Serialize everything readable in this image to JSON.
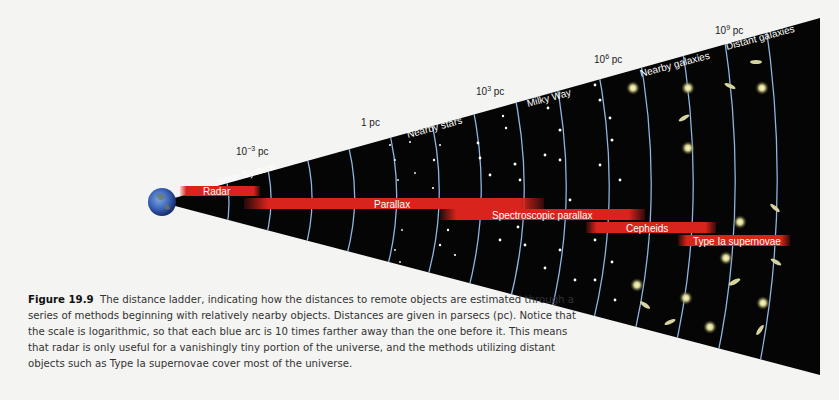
{
  "figure": {
    "number_label": "Figure 19.9",
    "caption": "The distance ladder, indicating how the distances to remote objects are estimated through a series of methods beginning with relatively nearby objects. Distances are given in parsecs (pc). Notice that the scale is logarithmic, so that each blue arc is 10 times farther away than the one before it. This means that radar is only useful for a vanishingly tiny portion of the universe, and the methods utilizing distant objects such as Type Ia supernovae cover most of the universe."
  },
  "distance_labels": [
    {
      "base": "10",
      "exp": "−3",
      "unit": " pc"
    },
    {
      "base": "1 pc",
      "exp": "",
      "unit": ""
    },
    {
      "base": "10",
      "exp": "3",
      "unit": " pc"
    },
    {
      "base": "10",
      "exp": "6",
      "unit": " pc"
    },
    {
      "base": "10",
      "exp": "9",
      "unit": " pc"
    }
  ],
  "region_labels": [
    "Solar System",
    "Nearby stars",
    "Milky Way",
    "Nearby galaxies",
    "Distant galaxies"
  ],
  "methods": [
    {
      "label": "Radar"
    },
    {
      "label": "Parallax"
    },
    {
      "label": "Spectroscopic parallax"
    },
    {
      "label": "Cepheids"
    },
    {
      "label": "Type Ia supernovae"
    }
  ],
  "colors": {
    "cone": "#050505",
    "arc": "#8fb4e0",
    "bar": "#d8241c",
    "background": "#f4f4f2"
  }
}
